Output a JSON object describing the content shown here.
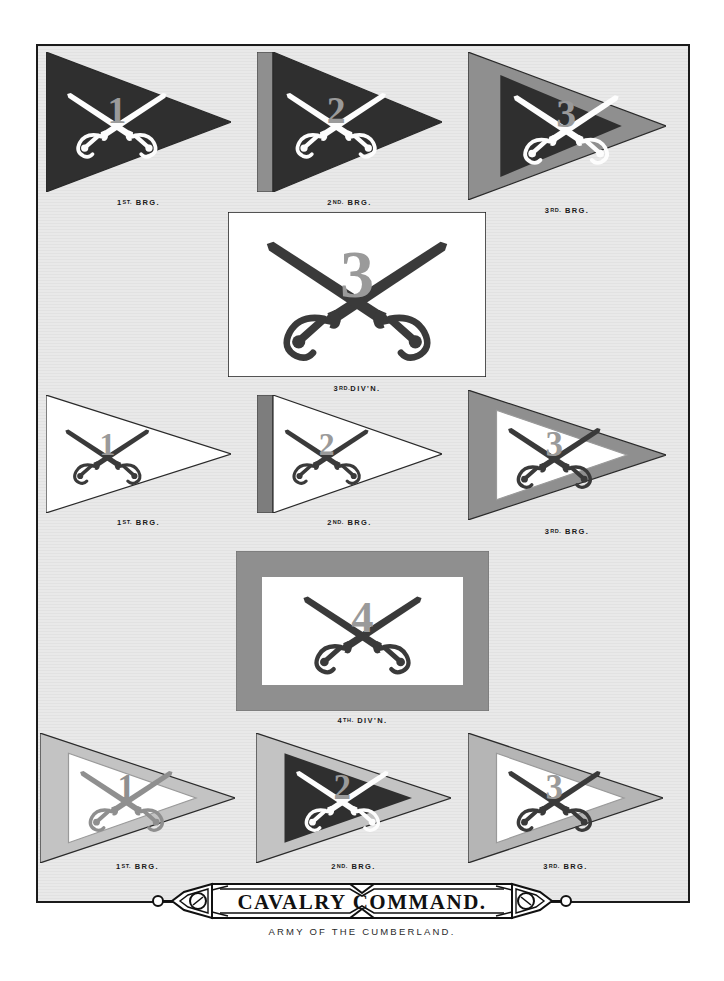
{
  "plate": {
    "title": "CAVALRY COMMAND.",
    "subtitle": "ARMY OF THE CUMBERLAND.",
    "background_color": "#e9e9e9",
    "frame_color": "#1b1b1b",
    "page_color": "#ffffff"
  },
  "palette": {
    "dark_field": "#2f2f2f",
    "white_field": "#ffffff",
    "mid_gray": "#8f8f8f",
    "light_gray": "#c3c3c3",
    "saber_dark": "#3a3a3a",
    "saber_white": "#fdfdfd",
    "numeral_gray": "#9a9a9a"
  },
  "flags": [
    {
      "id": "div3-brg1",
      "shape": "guidon",
      "numeral": "1",
      "caption_ordinal": "1ST.",
      "caption_rest": " BRG.",
      "field_color": "#2f2f2f",
      "border_color": "none",
      "border_style": "none",
      "saber_color": "#fdfdfd",
      "numeral_color": "#9a9a9a"
    },
    {
      "id": "div3-brg2",
      "shape": "guidon",
      "numeral": "2",
      "caption_ordinal": "2ND.",
      "caption_rest": " BRG.",
      "field_color": "#2f2f2f",
      "border_color": "#8f8f8f",
      "border_style": "hoist-stripe",
      "saber_color": "#fdfdfd",
      "numeral_color": "#9a9a9a"
    },
    {
      "id": "div3-brg3",
      "shape": "guidon",
      "numeral": "3",
      "caption_ordinal": "3RD.",
      "caption_rest": " BRG.",
      "field_color": "#2f2f2f",
      "border_color": "#8f8f8f",
      "border_style": "full-border",
      "saber_color": "#fdfdfd",
      "numeral_color": "#9a9a9a"
    },
    {
      "id": "div4-brg1",
      "shape": "guidon",
      "numeral": "1",
      "caption_ordinal": "1ST.",
      "caption_rest": " BRG.",
      "field_color": "#ffffff",
      "border_color": "none",
      "border_style": "none",
      "saber_color": "#3a3a3a",
      "numeral_color": "#9a9a9a"
    },
    {
      "id": "div4-brg2",
      "shape": "guidon",
      "numeral": "2",
      "caption_ordinal": "2ND.",
      "caption_rest": " BRG.",
      "field_color": "#ffffff",
      "border_color": "#7d7d7d",
      "border_style": "hoist-stripe",
      "saber_color": "#3a3a3a",
      "numeral_color": "#9a9a9a"
    },
    {
      "id": "div4-brg3",
      "shape": "guidon",
      "numeral": "3",
      "caption_ordinal": "3RD.",
      "caption_rest": " BRG.",
      "field_color": "#ffffff",
      "border_color": "#8f8f8f",
      "border_style": "full-border",
      "saber_color": "#3a3a3a",
      "numeral_color": "#9a9a9a"
    },
    {
      "id": "res-brg1",
      "shape": "guidon",
      "numeral": "1",
      "caption_ordinal": "1ST.",
      "caption_rest": " BRG.",
      "field_color": "#ffffff",
      "border_color": "#c3c3c3",
      "border_style": "full-border",
      "saber_color": "#8f8f8f",
      "numeral_color": "#8f8f8f"
    },
    {
      "id": "res-brg2",
      "shape": "guidon",
      "numeral": "2",
      "caption_ordinal": "2ND.",
      "caption_rest": " BRG.",
      "field_color": "#2f2f2f",
      "border_color": "#c3c3c3",
      "border_style": "full-border",
      "saber_color": "#fdfdfd",
      "numeral_color": "#9a9a9a"
    },
    {
      "id": "res-brg3",
      "shape": "guidon",
      "numeral": "3",
      "caption_ordinal": "3RD.",
      "caption_rest": " BRG.",
      "field_color": "#ffffff",
      "border_color": "#b5b5b5",
      "border_style": "full-border",
      "saber_color": "#3a3a3a",
      "numeral_color": "#9a9a9a"
    }
  ],
  "divisions": [
    {
      "id": "div3",
      "shape": "rectangle",
      "numeral": "3",
      "caption_ordinal": "3RD.",
      "caption_rest": "DIV'N.",
      "field_color": "#ffffff",
      "border_color": "none",
      "border_style": "none",
      "saber_color": "#3a3a3a",
      "numeral_color": "#9a9a9a"
    },
    {
      "id": "div4",
      "shape": "rectangle",
      "numeral": "4",
      "caption_ordinal": "4TH.",
      "caption_rest": " DIV'N.",
      "field_color": "#ffffff",
      "border_color": "#8f8f8f",
      "border_style": "full-border",
      "saber_color": "#3a3a3a",
      "numeral_color": "#9a9a9a"
    }
  ]
}
